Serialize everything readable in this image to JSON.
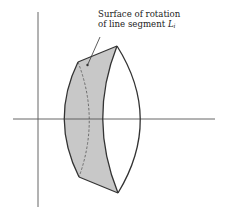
{
  "figure": {
    "annotation": {
      "line1": "Surface of rotation",
      "line2_prefix": "of line segment ",
      "symbol": "L",
      "subscript": "i"
    },
    "colors": {
      "ink": "#333333",
      "axis": "#555555",
      "shade": "#c8c8c8",
      "background": "#ffffff"
    },
    "elements": [
      "vertical-axis",
      "horizontal-axis",
      "shaded-surface-of-rotation",
      "lens-front-arc",
      "lens-right-arc",
      "hidden-dashed-arc",
      "leader-line"
    ]
  }
}
